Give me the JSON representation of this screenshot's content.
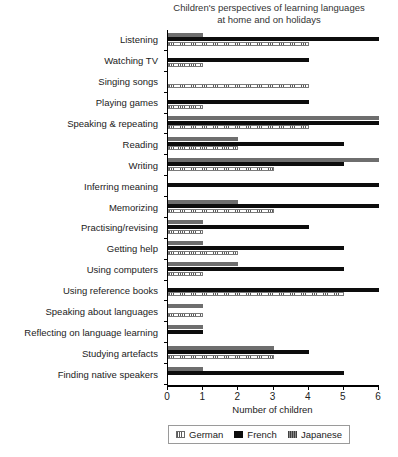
{
  "chart_data": {
    "type": "bar",
    "orientation": "horizontal",
    "title": "Children's perspectives of learning languages at home and on holidays",
    "title_line1": "Children's perspectives of learning languages",
    "title_line2": "at home and on holidays",
    "xlabel": "Number of children",
    "ylabel": "",
    "xlim": [
      0,
      6
    ],
    "xticks": [
      0,
      1,
      2,
      3,
      4,
      5,
      6
    ],
    "xtick_labels": [
      "0",
      "1",
      "2",
      "3",
      "4",
      "5",
      "6"
    ],
    "grid": false,
    "legend_position": "bottom",
    "categories": [
      "Listening",
      "Watching TV",
      "Singing songs",
      "Playing games",
      "Speaking & repeating",
      "Reading",
      "Writing",
      "Inferring meaning",
      "Memorizing",
      "Practising/revising",
      "Getting help",
      "Using computers",
      "Using reference books",
      "Speaking about languages",
      "Reflecting on language learning",
      "Studying artefacts",
      "Finding native speakers"
    ],
    "series": [
      {
        "name": "Japanese",
        "color": "#6e6e6e",
        "values": [
          1,
          0,
          0,
          0,
          6,
          2,
          6,
          0,
          2,
          1,
          1,
          2,
          0,
          1,
          1,
          3,
          1
        ]
      },
      {
        "name": "French",
        "color": "#0d0d0d",
        "values": [
          6,
          4,
          0,
          4,
          6,
          5,
          5,
          6,
          6,
          4,
          5,
          5,
          6,
          0,
          1,
          4,
          5
        ]
      },
      {
        "name": "German",
        "color": "#ffffff",
        "values": [
          4,
          1,
          4,
          1,
          4,
          2,
          3,
          0,
          3,
          1,
          2,
          1,
          5,
          1,
          0,
          3,
          0
        ]
      }
    ]
  },
  "legend": {
    "items": [
      {
        "label": "German",
        "swatch": "german-swatch"
      },
      {
        "label": "French",
        "swatch": "french-swatch"
      },
      {
        "label": "Japanese",
        "swatch": "japanese-swatch"
      }
    ]
  }
}
